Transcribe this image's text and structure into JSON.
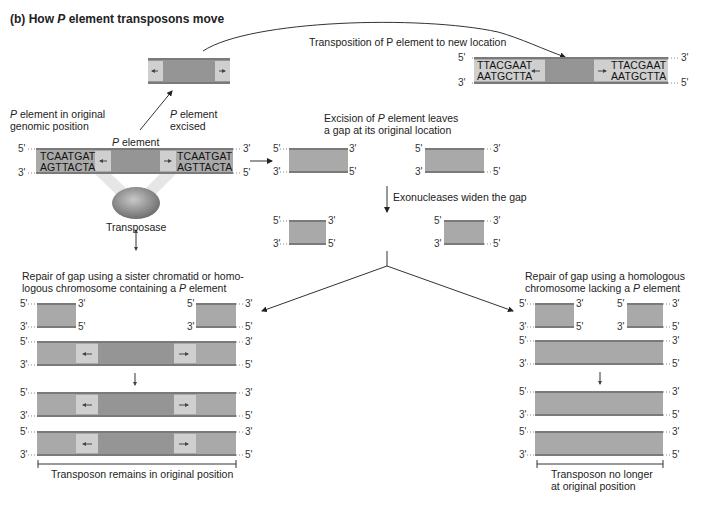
{
  "title": "(b)  How P element transposons move",
  "title_parts": {
    "prefix": "(b)  How ",
    "italic": "P",
    "suffix": " element transposons move"
  },
  "labels": {
    "transposition": "Transposition of P element to new location",
    "original_line1": "element in original",
    "original_line2": "genomic position",
    "excised_line1": "element",
    "excised_line2": "excised",
    "p_element": "element",
    "p": "P",
    "transposase": "Transposase",
    "excision_line1_pre": "Excision of ",
    "excision_line1_post": " element leaves",
    "excision_line2": "a gap at its original location",
    "exonucleases": "Exonucleases widen the gap",
    "repair_sister_line1": "Repair of gap using a sister chromatid or homo-",
    "repair_sister_line2_pre": "logous chromosome containing a ",
    "repair_sister_line2_post": " element",
    "repair_homolog_line1": "Repair of gap using a homologous",
    "repair_homolog_line2_pre": "chromosome lacking a ",
    "repair_homolog_line2_post": " element",
    "remains": "Transposon remains in original position",
    "no_longer_line1": "Transposon no longer",
    "no_longer_line2": "at original position"
  },
  "sequences": {
    "original_top": "TCAATGAT",
    "original_bottom": "AGTTACTA",
    "new_top": "TTACGAAT",
    "new_bottom": "AATGCTTA"
  },
  "ends": {
    "five": "5'",
    "three": "3'"
  },
  "colors": {
    "dna_fill": "#a9a9a9",
    "pelement_core": "#959595",
    "inverted_repeat": "#cfcfcf",
    "strand_line": "#7a7a7a",
    "transposase": "#8a8a8a"
  }
}
